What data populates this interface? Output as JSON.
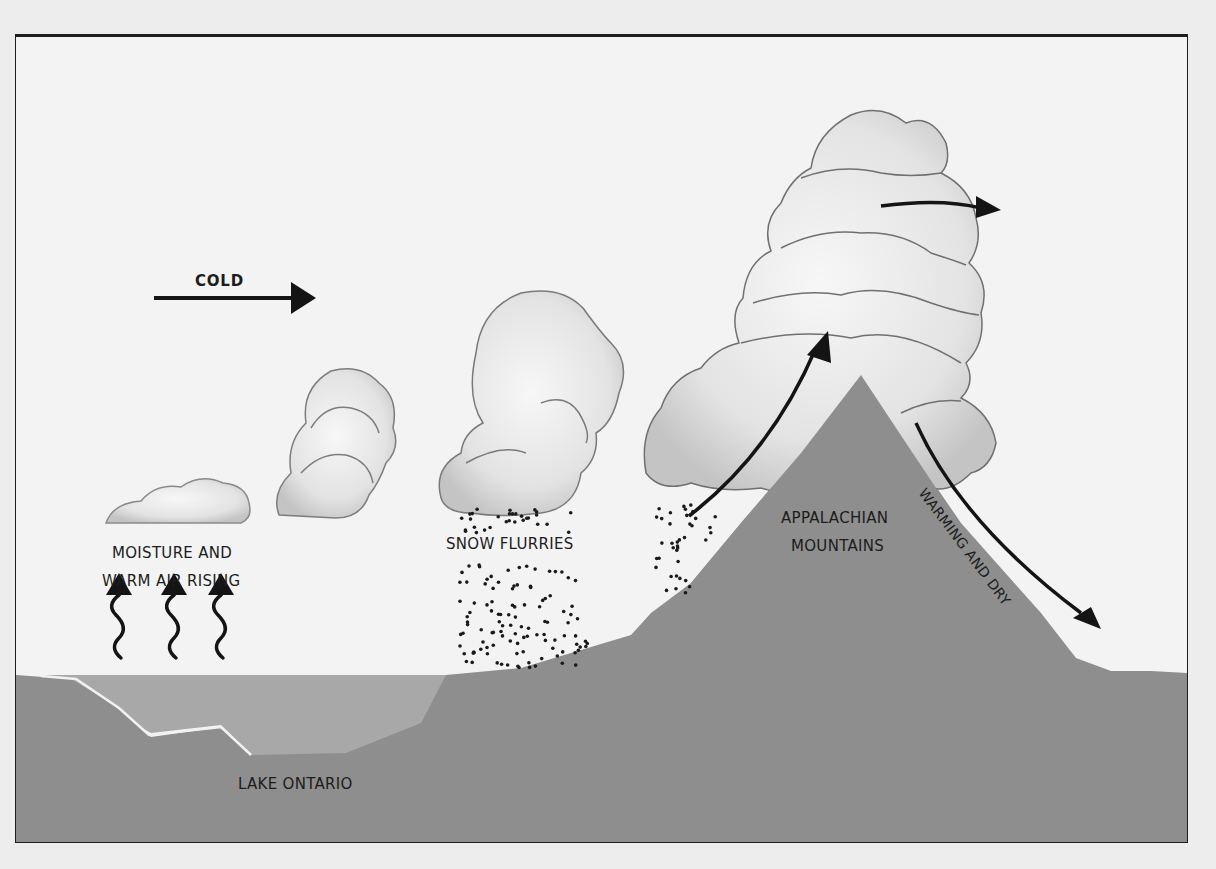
{
  "diagram": {
    "type": "lake-effect snow cross-section",
    "labels": {
      "cold": "COLD",
      "moisture_line1": "MOISTURE AND",
      "moisture_line2": "WARM AIR RISING",
      "snow": "SNOW FLURRIES",
      "mountains_line1": "APPALACHIAN",
      "mountains_line2": "MOUNTAINS",
      "lake": "LAKE ONTARIO",
      "warming": "WARMING AND DRY"
    },
    "colors": {
      "ground": "#8f8f8f",
      "lake": "#a9a9a9",
      "sky": "#f3f3f3",
      "ink": "#1a1a1a",
      "cloud_fill": "#e6e6e6",
      "cloud_edge": "#7a7a7a"
    }
  }
}
